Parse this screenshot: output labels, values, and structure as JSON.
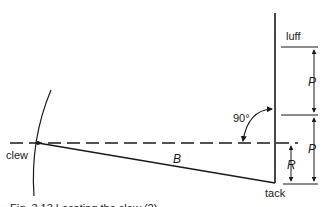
{
  "diagram": {
    "labels": {
      "luff": "luff",
      "clew": "clew",
      "tack": "tack",
      "boom": "B",
      "angle": "90°",
      "p_upper": "P",
      "p_lower": "P",
      "r": "R"
    },
    "caption": "Fig. 3.13  Locating the clew (2)",
    "colors": {
      "ink": "#1a1a1a",
      "background": "#ffffff"
    }
  }
}
